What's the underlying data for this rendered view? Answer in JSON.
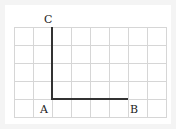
{
  "diagram": {
    "grid": {
      "columns": 8,
      "rows": 5,
      "line_color": "#d6d6d6"
    },
    "segments": [
      {
        "name": "AC",
        "from": "A",
        "to": "C"
      },
      {
        "name": "AB",
        "from": "A",
        "to": "B"
      }
    ],
    "points": {
      "A": {
        "label": "A"
      },
      "B": {
        "label": "B"
      },
      "C": {
        "label": "C"
      }
    },
    "segment_color": "#333333"
  }
}
